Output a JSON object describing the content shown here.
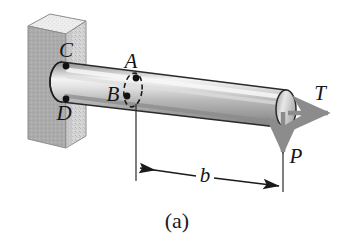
{
  "figure": {
    "caption": "(a)",
    "background_color": "#ffffff"
  },
  "labels": {
    "point_a": "A",
    "point_b": "B",
    "point_c": "C",
    "point_d": "D",
    "torque": "T",
    "load": "P",
    "dimension_b": "b"
  },
  "colors": {
    "wall_front": "#d0d0d0",
    "wall_top": "#efefef",
    "wall_side": "#a9a9a9",
    "bar_light": "#f2f2f2",
    "bar_mid": "#c2c2c2",
    "bar_dark": "#8d8d8d",
    "arrow_gray": "#8c8c8c",
    "line_black": "#1a1a1a",
    "marker_black": "#111111"
  },
  "geometry": {
    "bar_axis_label": "cantilever-bar",
    "torque_arrow_type": "double-head",
    "load_arrow_type": "single-head",
    "section_marker": "dashed-ellipse"
  }
}
